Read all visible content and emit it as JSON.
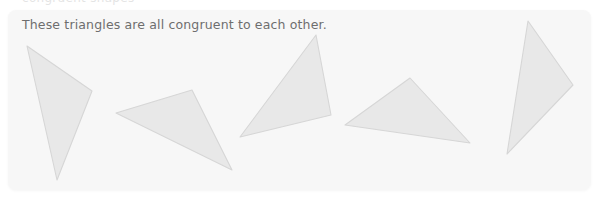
{
  "clipped_text_above": "congruent shapes",
  "card": {
    "background_color": "#f7f7f7",
    "corner_radius_px": 8
  },
  "caption": {
    "text": "These triangles are all congruent to each other.",
    "color": "#6e6e6e"
  },
  "figure": {
    "shape_fill_color": "#e8e8e8",
    "shape_stroke_color": "#d6d6d6",
    "shape_count": 5,
    "triangles": [
      {
        "name": "triangle-1",
        "points": "19,36 84,81 49,170",
        "orientation": "tall, apex upper-left"
      },
      {
        "name": "triangle-2",
        "points": "108,103 184,80 224,160",
        "orientation": "reclined, pointing lower-right"
      },
      {
        "name": "triangle-3",
        "points": "308,25 323,105 232,127",
        "orientation": "apex top, base lower-left"
      },
      {
        "name": "triangle-4",
        "points": "402,68 337,115 462,133",
        "orientation": "wide, apex top-center"
      },
      {
        "name": "triangle-5",
        "points": "520,11 565,75 499,144",
        "orientation": "tall, pointing right"
      }
    ]
  }
}
